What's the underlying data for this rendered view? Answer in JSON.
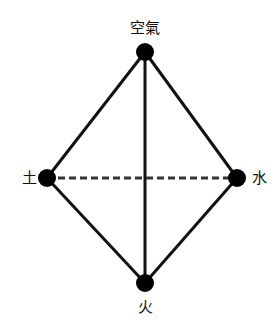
{
  "diagram": {
    "type": "tetrahedron-elements",
    "colors": {
      "background": "#ffffff",
      "line": "#111111",
      "dashed_line": "#333333",
      "node": "#000000",
      "text": "#111111"
    },
    "nodes": [
      {
        "id": "air",
        "label": "空氣",
        "x": 145,
        "y": 52,
        "r": 9,
        "label_x": 145,
        "label_y": 33,
        "anchor": "middle"
      },
      {
        "id": "earth",
        "label": "土",
        "x": 47,
        "y": 178,
        "r": 9,
        "label_x": 29,
        "label_y": 183,
        "anchor": "middle"
      },
      {
        "id": "water",
        "label": "水",
        "x": 237,
        "y": 178,
        "r": 9,
        "label_x": 259,
        "label_y": 183,
        "anchor": "middle"
      },
      {
        "id": "fire",
        "label": "火",
        "x": 145,
        "y": 283,
        "r": 9,
        "label_x": 145,
        "label_y": 312,
        "anchor": "middle"
      }
    ],
    "edges": [
      {
        "from": "air",
        "to": "earth",
        "style": "solid"
      },
      {
        "from": "air",
        "to": "water",
        "style": "solid"
      },
      {
        "from": "air",
        "to": "fire",
        "style": "solid"
      },
      {
        "from": "earth",
        "to": "fire",
        "style": "solid"
      },
      {
        "from": "water",
        "to": "fire",
        "style": "solid"
      },
      {
        "from": "earth",
        "to": "water",
        "style": "dashed"
      }
    ]
  }
}
